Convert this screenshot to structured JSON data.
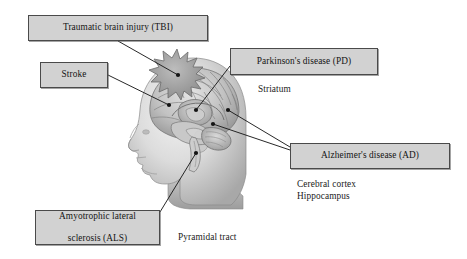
{
  "figure": {
    "background_color": "#ffffff",
    "width": 467,
    "height": 259
  },
  "illustration": {
    "subject": "lateral view of a human head facing left with a semi-transparent brain visible inside",
    "head_color": "#d9d9d9",
    "brain_color": "#b9b9b9",
    "impact_marker": {
      "name": "starburst-impact-icon",
      "meaning": "traumatic impact site on the frontal/parietal skull",
      "color": "#9a9a9a"
    },
    "leader_line_color": "#1c1c1c",
    "marker_dot_color": "#141414"
  },
  "callouts": [
    {
      "id": "tbi",
      "label": "Traumatic brain injury (TBI)",
      "lines": [
        "Traumatic brain injury (TBI)"
      ],
      "target": "impact starburst on skull"
    },
    {
      "id": "stroke",
      "label": "Stroke",
      "lines": [
        "Stroke"
      ],
      "target": "cerebral cortex / middle cerebral artery territory"
    },
    {
      "id": "pd",
      "label": "Parkinson's disease (PD)",
      "lines": [
        "Parkinson's disease (PD)"
      ],
      "target": "striatum"
    },
    {
      "id": "ad",
      "label": "Alzheimer's disease (AD)",
      "lines": [
        "Alzheimer's disease (AD)"
      ],
      "target": "cerebral cortex and hippocampus"
    },
    {
      "id": "als",
      "label": "Amyotrophic lateral sclerosis (ALS)",
      "lines": [
        "Amyotrophic lateral",
        "sclerosis (ALS)"
      ],
      "target": "pyramidal tract / brainstem"
    }
  ],
  "annotations": [
    {
      "id": "striatum",
      "text": "Striatum"
    },
    {
      "id": "ad_parts",
      "text": "Cerebral cortex\nHippocampus"
    },
    {
      "id": "pyramidal",
      "text": "Pyramidal tract"
    }
  ],
  "colors": {
    "box_fill": "#d2d2d2",
    "box_border": "#4a4a4a",
    "text": "#141414",
    "line": "#1c1c1c"
  }
}
